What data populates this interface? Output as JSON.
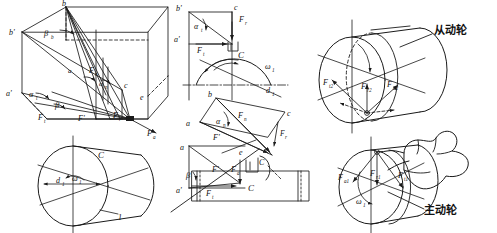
{
  "figure": {
    "type": "engineering-diagram",
    "panels": [
      "box-3d-force-resolution",
      "orthographic-projections",
      "driven-wheel",
      "driving-wheel"
    ]
  },
  "panel_box": {
    "name": "3D force resolution box",
    "vertices": {
      "b": "b",
      "b_prime": "b'",
      "a": "a",
      "a_prime": "a'",
      "c": "c",
      "e": "e"
    },
    "angles": {
      "beta_b": "β",
      "beta_b_sub": "b",
      "alpha_t": "α",
      "alpha_t_sub": "t",
      "alpha_n": "α",
      "alpha_n_sub": "n",
      "beta": "β"
    },
    "forces": {
      "Fn": "F",
      "Fn_sub": "n",
      "Ft": "F",
      "Ft_sub": "t",
      "Fr": "F",
      "Fr_sub": "r",
      "Fa": "F",
      "Fa_sub": "a",
      "Fprime": "F'"
    },
    "cylinder": {
      "center": "C",
      "diameter": "d",
      "diameter_sub": "1",
      "omega": "ω",
      "omega_sub": "1",
      "gear_number": "1"
    }
  },
  "panel_projections": {
    "name": "orthographic projection views",
    "top_view": {
      "b_prime": "b'",
      "c": "c",
      "a_prime": "a'",
      "alpha_t": "α",
      "alpha_t_sub": "t",
      "Ft": "F",
      "Ft_sub": "t",
      "Fr": "F",
      "Fr_sub": "r",
      "center": "C",
      "omega": "ω",
      "omega_sub": "1",
      "d1": "d",
      "d1_sub": "1"
    },
    "mid_view": {
      "a": "a",
      "b": "b",
      "c": "c",
      "alpha_n": "α",
      "alpha_n_sub": "n",
      "Fn": "F",
      "Fn_sub": "n",
      "Fprime": "F'",
      "Fr": "F",
      "Fr_sub": "r"
    },
    "front_view": {
      "a": "a",
      "a_prime": "a'",
      "e": "e",
      "beta": "β",
      "Fprime": "F'",
      "Fa": "F",
      "Fa_sub": "a",
      "Ft": "F",
      "Ft_sub": "t",
      "center": "C"
    }
  },
  "panel_driven": {
    "name": "driven wheel",
    "label_cjk": "从动轮",
    "forces": {
      "Ft2": "F",
      "Ft2_sub": "t2",
      "Fr2": "F",
      "Fr2_sub": "r2",
      "Fa2": "F",
      "Fa2_sub": "a2"
    }
  },
  "panel_driving": {
    "name": "driving wheel",
    "label_cjk": "主动轮",
    "forces": {
      "Fa1": "F",
      "Fa1_sub": "a1",
      "Fr1": "F",
      "Fr1_sub": "r1",
      "Ft1": "F",
      "Ft1_sub": "t1"
    },
    "omega": "ω",
    "omega_sub": "1"
  },
  "colors": {
    "stroke": "#1a1a1a",
    "background": "#ffffff"
  }
}
